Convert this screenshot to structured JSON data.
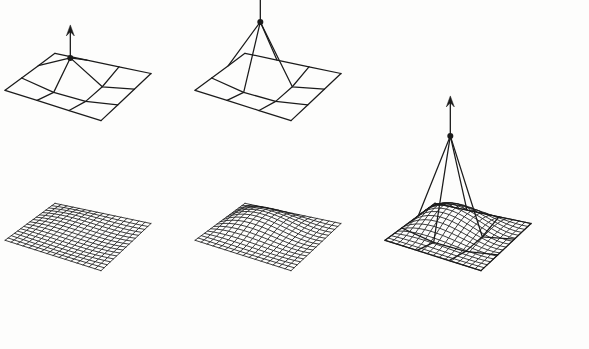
{
  "figure": {
    "title": "Control point displacement and resulting subdivision surfaces",
    "background_color": "#fdfdfc",
    "ink_color": "#1b1b1b",
    "width": 589,
    "height": 349,
    "rows": 2,
    "columns": 3,
    "row_labels": [
      "control-net-row",
      "limit-surface-row"
    ]
  },
  "panels": [
    {
      "id": "panel-1",
      "index": 1,
      "label": "left",
      "arrow_label": "up-arrow",
      "control_point_label": "moved-control-vertex",
      "displacement": 0.35,
      "arrow_length_px": 33,
      "net_origin_x": 78,
      "net_origin_y": 96,
      "surface_origin_x": 78,
      "surface_origin_y": 246
    },
    {
      "id": "panel-2",
      "index": 2,
      "label": "middle",
      "arrow_label": "up-arrow",
      "control_point_label": "moved-control-vertex",
      "displacement": 0.95,
      "arrow_length_px": 38,
      "net_origin_x": 268,
      "net_origin_y": 96,
      "surface_origin_x": 268,
      "surface_origin_y": 246
    },
    {
      "id": "panel-3",
      "index": 3,
      "label": "right",
      "arrow_label": "up-arrow",
      "control_point_label": "moved-control-vertex",
      "displacement": 1.55,
      "arrow_length_px": 40,
      "net_origin_x": 458,
      "net_origin_y": 246,
      "surface_origin_x": 458,
      "surface_origin_y": 246
    }
  ],
  "chart_data": {
    "type": "line",
    "xlabel": "",
    "ylabel": "",
    "categories": [
      "left",
      "middle",
      "right"
    ],
    "series": [
      {
        "name": "control-point-height",
        "values": [
          0.35,
          0.95,
          1.55
        ]
      },
      {
        "name": "arrow-length-px",
        "values": [
          33,
          38,
          40
        ]
      }
    ],
    "grid": false,
    "legend": "none"
  },
  "geometry": {
    "control_net_cells": 3,
    "control_net_vertices": 4,
    "fine_mesh_cells": 16,
    "fine_mesh_vertices": 17,
    "moved_vertex_row": 1,
    "moved_vertex_col": 1,
    "projection": {
      "scale_x": 96,
      "scale_y": 96,
      "height_scale": 60,
      "skew_x": -0.52,
      "skew_y": 0.3,
      "tilt": 0.46
    },
    "base_warp": {
      "corner_lift": [
        0.3,
        0.05,
        0.42,
        0.0
      ],
      "edge_sag": 0.12
    },
    "line_widths": {
      "control_net": 1.25,
      "fine_mesh": 0.85,
      "arrow_shaft": 1.3
    },
    "dot_radius": 3.0
  }
}
